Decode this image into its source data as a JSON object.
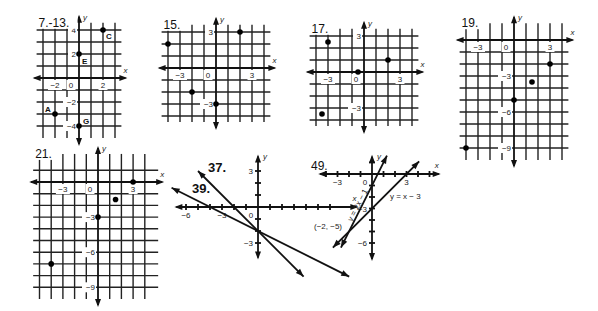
{
  "graphs": [
    {
      "id": "g7",
      "title": "7.-13.",
      "origin": [
        79,
        78
      ],
      "unit": 12,
      "xrange": [
        -3.2,
        3.2
      ],
      "yrange": [
        -5,
        4.6
      ],
      "grid": {
        "x": [
          -3,
          3
        ],
        "y": [
          -4,
          4
        ]
      },
      "x_ticks": [
        {
          "v": -2,
          "t": "−2"
        },
        {
          "v": 2,
          "t": "2"
        }
      ],
      "y_ticks": [
        {
          "v": 4,
          "t": "4"
        },
        {
          "v": 2,
          "t": "2"
        },
        {
          "v": -2,
          "t": "−2"
        },
        {
          "v": -4,
          "t": "−4"
        }
      ],
      "zero_label": "0",
      "axis_labels": {
        "x": "x",
        "y": "y"
      },
      "points": [
        {
          "x": 2,
          "y": 4,
          "label": "C",
          "dx": 3,
          "dy": 9
        },
        {
          "x": 0,
          "y": 2,
          "label": "E",
          "dx": 3,
          "dy": 10
        },
        {
          "x": -2,
          "y": -3,
          "label": "A",
          "dx": -10,
          "dy": -2
        },
        {
          "x": 0,
          "y": -4,
          "label": "G",
          "dx": 4,
          "dy": -2
        }
      ]
    },
    {
      "id": "g15",
      "title": "15.",
      "origin": [
        216,
        68
      ],
      "unit": 12,
      "xrange": [
        -4.2,
        4.2
      ],
      "yrange": [
        -4.5,
        3.6
      ],
      "grid": {
        "x": [
          -4,
          4
        ],
        "y": [
          -4,
          3
        ]
      },
      "x_ticks": [
        {
          "v": -3,
          "t": "−3"
        },
        {
          "v": 3,
          "t": "3"
        }
      ],
      "y_ticks": [
        {
          "v": 3,
          "t": "3"
        },
        {
          "v": -3,
          "t": "−3"
        }
      ],
      "zero_label": "0",
      "axis_labels": {
        "x": "x",
        "y": "y"
      },
      "points": [
        {
          "x": 2,
          "y": 3
        },
        {
          "x": -4,
          "y": 2
        },
        {
          "x": -2,
          "y": -2
        },
        {
          "x": 0,
          "y": -3
        }
      ]
    },
    {
      "id": "g17",
      "title": "17.",
      "origin": [
        364,
        72
      ],
      "unit": 12,
      "xrange": [
        -4.2,
        4.2
      ],
      "yrange": [
        -4.5,
        3.6
      ],
      "grid": {
        "x": [
          -4,
          4
        ],
        "y": [
          -4,
          3
        ]
      },
      "x_ticks": [
        {
          "v": -3,
          "t": "−3"
        },
        {
          "v": 3,
          "t": "3"
        }
      ],
      "y_ticks": [
        {
          "v": 3,
          "t": "3"
        },
        {
          "v": -3,
          "t": "−3"
        }
      ],
      "zero_label": "0",
      "axis_labels": {
        "x": "x",
        "y": "y"
      },
      "points": [
        {
          "x": -3,
          "y": 2.5
        },
        {
          "x": 2,
          "y": 1
        },
        {
          "x": -0.5,
          "y": 0
        },
        {
          "x": -3.5,
          "y": -3.5
        }
      ]
    },
    {
      "id": "g19",
      "title": "19.",
      "origin": [
        514,
        40
      ],
      "unit": 12,
      "xrange": [
        -4.2,
        4.2
      ],
      "yrange": [
        -10,
        1.4
      ],
      "grid": {
        "x": [
          -4,
          4
        ],
        "y": [
          -9,
          0
        ]
      },
      "x_ticks": [
        {
          "v": -3,
          "t": "−3"
        },
        {
          "v": 3,
          "t": "3"
        }
      ],
      "y_ticks": [
        {
          "v": -3,
          "t": "−3"
        },
        {
          "v": -6,
          "t": "−6"
        },
        {
          "v": -9,
          "t": "−9"
        }
      ],
      "zero_label": "0",
      "axis_labels": {
        "x": "x",
        "y": "y"
      },
      "points": [
        {
          "x": 3,
          "y": -2
        },
        {
          "x": 1.5,
          "y": -3.5
        },
        {
          "x": 0,
          "y": -5
        },
        {
          "x": -4,
          "y": -9
        }
      ]
    },
    {
      "id": "g21",
      "title": "21.",
      "origin": [
        98,
        182
      ],
      "unit": 11.7,
      "xrange": [
        -5.2,
        4.8
      ],
      "yrange": [
        -10,
        2.4
      ],
      "grid": {
        "x": [
          -5,
          4
        ],
        "y": [
          -9,
          1
        ]
      },
      "x_ticks": [
        {
          "v": -3,
          "t": "−3"
        },
        {
          "v": 3,
          "t": "3"
        }
      ],
      "y_ticks": [
        {
          "v": -3,
          "t": "−3"
        },
        {
          "v": -6,
          "t": "−6"
        },
        {
          "v": -9,
          "t": "−9"
        }
      ],
      "zero_label": "0",
      "axis_labels": {
        "x": "x",
        "y": "y"
      },
      "points": [
        {
          "x": 3,
          "y": 0
        },
        {
          "x": 1.5,
          "y": -1.5
        },
        {
          "x": 0,
          "y": -3
        },
        {
          "x": -4,
          "y": -7
        }
      ]
    }
  ],
  "line_graphs": [
    {
      "id": "g37_39",
      "titles": [
        {
          "t": "37.",
          "x": 208,
          "y": 172
        },
        {
          "t": "39.",
          "x": 192,
          "y": 193
        }
      ],
      "origin": [
        258,
        207
      ],
      "unit": 12,
      "x_ticks": [
        {
          "v": -6,
          "t": "−6"
        },
        {
          "v": -3,
          "t": "−3"
        }
      ],
      "y_ticks": [
        {
          "v": 3,
          "t": "3"
        },
        {
          "v": -3,
          "t": "−3"
        }
      ],
      "zero_label": "0",
      "axis_labels": {
        "x": "x",
        "y": "y"
      },
      "xaxis": [
        -6.8,
        8.2
      ],
      "yaxis": [
        -4.2,
        4.2
      ],
      "tick_range": {
        "x": [
          -6,
          6
        ],
        "y": [
          -3,
          3
        ]
      },
      "lines": [
        {
          "name": "37",
          "equation": "y = -x - 2",
          "slope": -1,
          "intercept": -2,
          "x1": -5,
          "x2": 3.8
        },
        {
          "name": "39",
          "equation": "y = -x/2 - 2",
          "slope": -0.5,
          "intercept": -2,
          "x1": -7.2,
          "x2": 7.6
        }
      ]
    },
    {
      "id": "g49",
      "titles": [
        {
          "t": "49.",
          "x": 311,
          "y": 170
        }
      ],
      "origin": [
        372,
        174
      ],
      "unit": 11.5,
      "x_ticks": [
        {
          "v": -3,
          "t": "−3"
        },
        {
          "v": 3,
          "t": "3"
        }
      ],
      "y_ticks": [
        {
          "v": -3,
          "t": "−3"
        },
        {
          "v": -6,
          "t": "−6"
        }
      ],
      "zero_label": "0",
      "axis_labels": {
        "x": "x",
        "y": "y"
      },
      "xaxis": [
        -4.5,
        5.8
      ],
      "yaxis": [
        -7.4,
        1.5
      ],
      "tick_range": {
        "x": [
          -4,
          5
        ],
        "y": [
          -6,
          1
        ]
      },
      "lines": [
        {
          "name": "a",
          "equation": "y = 2x − 1",
          "slope": 2,
          "intercept": -1,
          "x1": -2.7,
          "x2": 1.3
        },
        {
          "name": "b",
          "equation": "y = x − 3",
          "slope": 1,
          "intercept": -3,
          "x1": -3.4,
          "x2": 4.1
        }
      ],
      "labels": [
        {
          "t": "y = 2x − 1",
          "x": 352,
          "y": 222,
          "rot": -63
        },
        {
          "t": "y = x − 3",
          "x": 390,
          "y": 199,
          "rot": 0
        },
        {
          "t": "(−2, −5)",
          "x": 314,
          "y": 229,
          "rot": 0
        }
      ],
      "intersection": {
        "x": -2,
        "y": -5
      }
    }
  ]
}
